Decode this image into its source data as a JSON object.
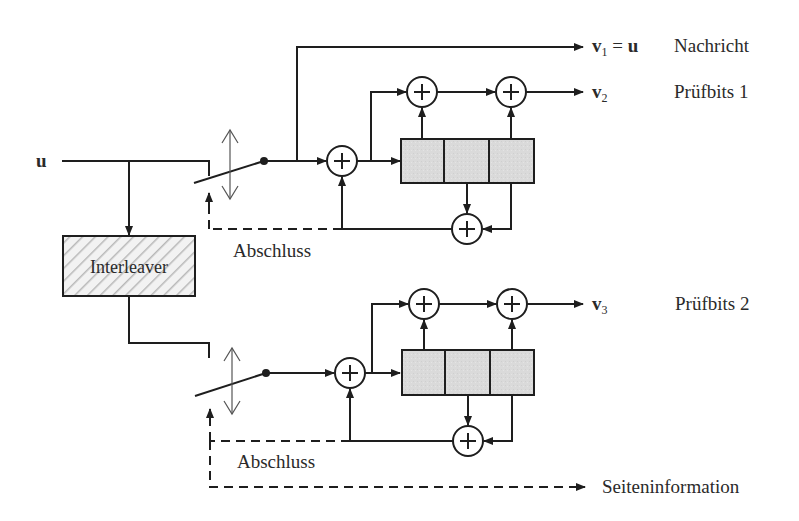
{
  "diagram": {
    "type": "turbo-encoder-block-diagram",
    "input": {
      "label": "u"
    },
    "interleaver": {
      "label": "Interleaver"
    },
    "outputs": [
      {
        "symbol": "v",
        "sub": "1",
        "eq": " = ",
        "rhs": "u",
        "description": "Nachricht"
      },
      {
        "symbol": "v",
        "sub": "2",
        "description": "Prüfbits 1"
      },
      {
        "symbol": "v",
        "sub": "3",
        "description": "Prüfbits 2"
      }
    ],
    "termination_label_top": "Abschluss",
    "termination_label_bottom": "Abschluss",
    "side_info_label": "Seiteninformation",
    "encoders": [
      {
        "name": "RSC encoder 1",
        "register_cells": 3
      },
      {
        "name": "RSC encoder 2",
        "register_cells": 3
      }
    ],
    "adder_symbol": "+",
    "colors": {
      "line": "#1e1e1e",
      "register_fill": "#d9d9d9",
      "interleaver_hatch": "#b8b8b8",
      "text": "#2a2a2a"
    }
  }
}
